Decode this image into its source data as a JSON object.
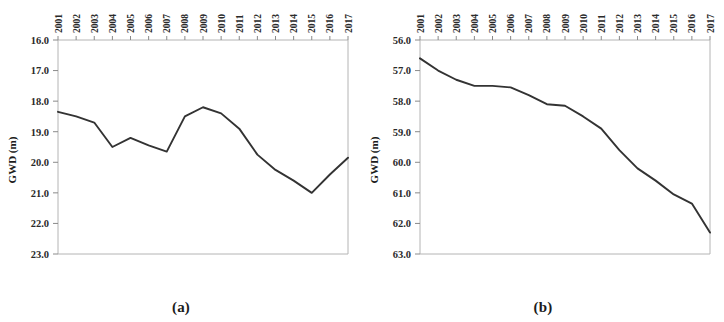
{
  "figure": {
    "panels": [
      {
        "caption": "(a)",
        "y_axis_title": "GWD (m)",
        "y_ticks": [
          "16.0",
          "17.0",
          "18.0",
          "19.0",
          "20.0",
          "21.0",
          "22.0",
          "23.0"
        ],
        "x_ticks": [
          "2001",
          "2002",
          "2003",
          "2004",
          "2005",
          "2006",
          "2007",
          "2008",
          "2009",
          "2010",
          "2011",
          "2012",
          "2013",
          "2014",
          "2015",
          "2016",
          "2017"
        ]
      },
      {
        "caption": "(b)",
        "y_axis_title": "GWD (m)",
        "y_ticks": [
          "56.0",
          "57.0",
          "58.0",
          "59.0",
          "60.0",
          "61.0",
          "62.0",
          "63.0"
        ],
        "x_ticks": [
          "2001",
          "2002",
          "2003",
          "2004",
          "2005",
          "2006",
          "2007",
          "2008",
          "2009",
          "2010",
          "2011",
          "2012",
          "2013",
          "2014",
          "2015",
          "2016",
          "2017"
        ]
      }
    ]
  },
  "chart_data": [
    {
      "type": "line",
      "title": "(a)",
      "xlabel": "",
      "ylabel": "GWD (m)",
      "x": [
        2001,
        2002,
        2003,
        2004,
        2005,
        2006,
        2007,
        2008,
        2009,
        2010,
        2011,
        2012,
        2013,
        2014,
        2015,
        2016,
        2017
      ],
      "values": [
        18.35,
        18.5,
        18.7,
        19.5,
        19.2,
        19.45,
        19.65,
        18.5,
        18.2,
        18.4,
        18.9,
        19.75,
        20.25,
        20.6,
        21.0,
        20.4,
        19.85
      ],
      "categories": [
        "2001",
        "2002",
        "2003",
        "2004",
        "2005",
        "2006",
        "2007",
        "2008",
        "2009",
        "2010",
        "2011",
        "2012",
        "2013",
        "2014",
        "2015",
        "2016",
        "2017"
      ],
      "ylim": [
        16.0,
        23.0
      ],
      "y_inverted": true,
      "y_ticks": [
        16.0,
        17.0,
        18.0,
        19.0,
        20.0,
        21.0,
        22.0,
        23.0
      ],
      "xlim": [
        2001,
        2017
      ],
      "grid": false,
      "legend": "none",
      "x_axis_position": "top",
      "line_color": "#333333",
      "series": [
        {
          "name": "GWD",
          "values": [
            18.35,
            18.5,
            18.7,
            19.5,
            19.2,
            19.45,
            19.65,
            18.5,
            18.2,
            18.4,
            18.9,
            19.75,
            20.25,
            20.6,
            21.0,
            20.4,
            19.85
          ]
        }
      ]
    },
    {
      "type": "line",
      "title": "(b)",
      "xlabel": "",
      "ylabel": "GWD (m)",
      "x": [
        2001,
        2002,
        2003,
        2004,
        2005,
        2006,
        2007,
        2008,
        2009,
        2010,
        2011,
        2012,
        2013,
        2014,
        2015,
        2016,
        2017
      ],
      "values": [
        56.6,
        57.0,
        57.3,
        57.5,
        57.5,
        57.55,
        57.8,
        58.1,
        58.15,
        58.5,
        58.9,
        59.6,
        60.2,
        60.6,
        61.05,
        61.35,
        62.3
      ],
      "categories": [
        "2001",
        "2002",
        "2003",
        "2004",
        "2005",
        "2006",
        "2007",
        "2008",
        "2009",
        "2010",
        "2011",
        "2012",
        "2013",
        "2014",
        "2015",
        "2016",
        "2017"
      ],
      "ylim": [
        56.0,
        63.0
      ],
      "y_inverted": true,
      "y_ticks": [
        56.0,
        57.0,
        58.0,
        59.0,
        60.0,
        61.0,
        62.0,
        63.0
      ],
      "xlim": [
        2001,
        2017
      ],
      "grid": false,
      "legend": "none",
      "x_axis_position": "top",
      "line_color": "#333333",
      "series": [
        {
          "name": "GWD",
          "values": [
            56.6,
            57.0,
            57.3,
            57.5,
            57.5,
            57.55,
            57.8,
            58.1,
            58.15,
            58.5,
            58.9,
            59.6,
            60.2,
            60.6,
            61.05,
            61.35,
            62.3
          ]
        }
      ]
    }
  ]
}
